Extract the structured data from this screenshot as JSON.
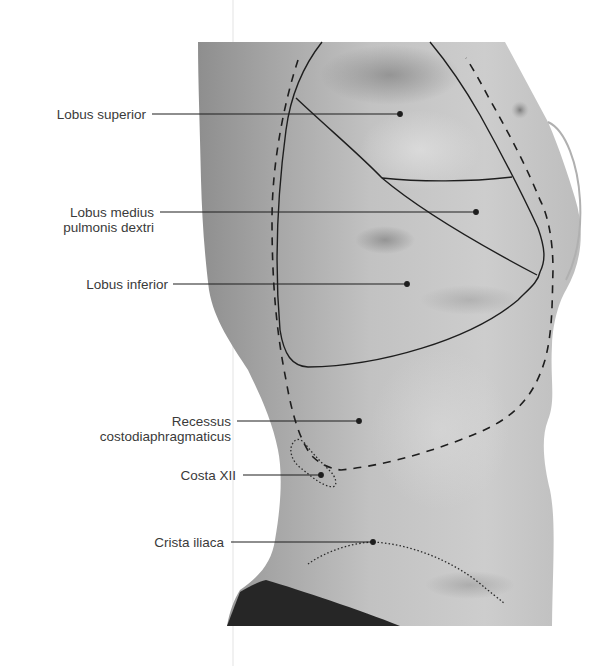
{
  "figure": {
    "colors": {
      "background": "#ffffff",
      "skin_light": "#d2d2d2",
      "skin_mid": "#b4b4b4",
      "skin_dark": "#8e8e8e",
      "shorts": "#262626",
      "line": "#1e1e1e",
      "text": "#3a3a3a",
      "page_fold": "#ececec"
    }
  },
  "labels": [
    {
      "id": "lobus-superior",
      "lines": [
        "Lobus superior"
      ],
      "target": [
        400,
        114
      ]
    },
    {
      "id": "lobus-medius",
      "lines": [
        "Lobus medius",
        "pulmonis dextri"
      ],
      "target": [
        476,
        212
      ]
    },
    {
      "id": "lobus-inferior",
      "lines": [
        "Lobus inferior"
      ],
      "target": [
        407,
        284
      ]
    },
    {
      "id": "recessus",
      "lines": [
        "Recessus",
        "costodiaphragmaticus"
      ],
      "target": [
        359,
        421
      ]
    },
    {
      "id": "costa-xii",
      "lines": [
        "Costa XII"
      ],
      "target": [
        321,
        475
      ]
    },
    {
      "id": "crista-iliaca",
      "lines": [
        "Crista iliaca"
      ],
      "target": [
        373,
        542
      ]
    }
  ],
  "structures": {
    "lung_outline": "solid line — lobus superior, medius and inferior boundaries",
    "pleura_boundary": "dashed line — pleural reflection / recessus costodiaphragmaticus",
    "costa_xii": "dotted outline — 12th rib",
    "crista_iliaca": "dotted curve — iliac crest"
  }
}
